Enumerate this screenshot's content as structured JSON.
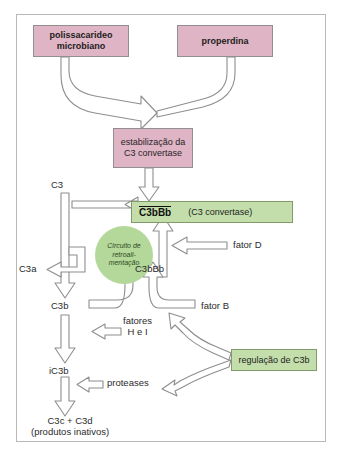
{
  "figure": {
    "title_present": false,
    "language": "pt-BR",
    "colors": {
      "pink_box": "#dfb4c4",
      "green_box": "#c3ddab",
      "circle_green": "#b4d79a",
      "arrow_stroke": "#8e8e8e",
      "border": "#b9b7b7",
      "text": "#2b2b2b"
    }
  },
  "nodes": {
    "polysaccharide": {
      "line1": "polissacarideo",
      "line2": "microbiano"
    },
    "properdin": {
      "label": "properdina"
    },
    "stabilization": {
      "line1": "estabilização da",
      "line2": "C3 convertase"
    },
    "convertase": {
      "name": "C3bBb",
      "paren": "(C3 convertase)"
    },
    "feedback_circle": {
      "line1": "Circuito de",
      "line2": "retroali-",
      "line3": "mentação"
    },
    "regulation": {
      "label": "regulação de C3b"
    }
  },
  "labels": {
    "c3": "C3",
    "c3a": "C3a",
    "c3b": "C3b",
    "c3bbb_mid": "C3bBb",
    "fator_d": "fator D",
    "fator_b": "fator B",
    "fatores_h_i_line1": "fatores",
    "fatores_h_i_line2": "H e I",
    "ic3b": "iC3b",
    "proteases": "proteases",
    "products_line1": "C3c + C3d",
    "products_line2": "(produtos inativos)"
  }
}
